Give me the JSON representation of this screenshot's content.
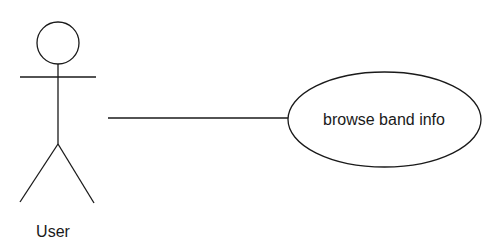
{
  "diagram": {
    "type": "use-case",
    "actor": {
      "label": "User"
    },
    "use_case": {
      "label": "browse band info"
    },
    "association": {
      "from": "User",
      "to": "browse band info"
    },
    "colors": {
      "stroke": "#1a1a1a",
      "background": "#ffffff"
    }
  }
}
